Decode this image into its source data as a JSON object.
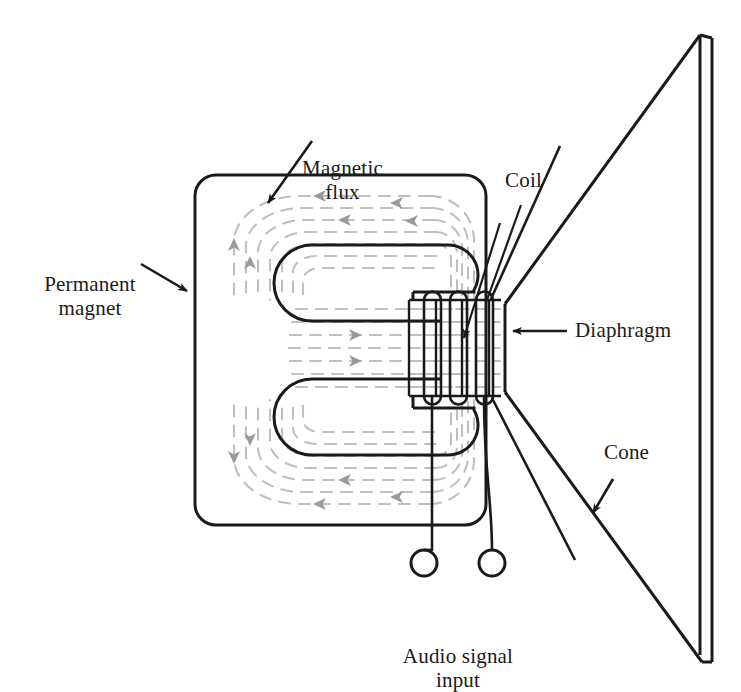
{
  "figure": {
    "background_color": "#ffffff",
    "ink_color": "#1a1a1a",
    "flux_color": "#bfbfbf",
    "flux_arrow_color": "#9a9a9a",
    "width": 741,
    "height": 692
  },
  "labels": {
    "permanent_magnet": "Permanent\nmagnet",
    "magnetic_flux": "Magnetic\nflux",
    "coil": "Coil",
    "diaphragm": "Diaphragm",
    "cone": "Cone",
    "audio_signal_input": "Audio signal\ninput"
  },
  "parts": {
    "magnet": {
      "name": "Permanent magnet",
      "shape": "rounded-rectangle-E-core",
      "outline_color": "#1a1a1a"
    },
    "coil": {
      "name": "Coil",
      "turns_visible": 3,
      "outline_color": "#1a1a1a"
    },
    "diaphragm": {
      "name": "Diaphragm",
      "outline_color": "#1a1a1a"
    },
    "cone": {
      "name": "Cone",
      "outline_color": "#1a1a1a"
    },
    "terminals": {
      "name": "Audio signal input terminals",
      "count": 2,
      "outline_color": "#1a1a1a"
    },
    "flux": {
      "name": "Magnetic flux lines",
      "style": "dashed",
      "color": "#bfbfbf"
    }
  }
}
